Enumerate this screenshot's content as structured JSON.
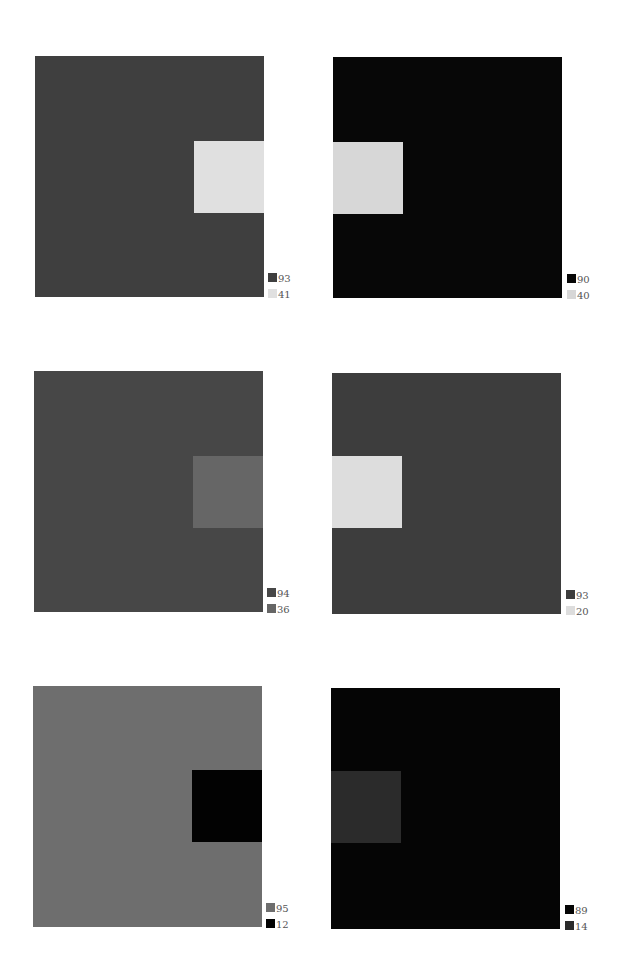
{
  "figures": [
    {
      "id": "panel-1",
      "background": {
        "value": "93",
        "color": "#3f3f3f"
      },
      "inner": {
        "value": "41",
        "color": "#e0e0e0",
        "side": "right"
      },
      "box": {
        "left": 35,
        "top": 56
      },
      "inner_offset": {
        "left": 159,
        "top": 85
      },
      "legend_pos": {
        "left": 268,
        "top": 272
      }
    },
    {
      "id": "panel-2",
      "background": {
        "value": "90",
        "color": "#070707"
      },
      "inner": {
        "value": "40",
        "color": "#d7d7d7",
        "side": "left"
      },
      "box": {
        "left": 333,
        "top": 57
      },
      "inner_offset": {
        "left": 0,
        "top": 85
      },
      "legend_pos": {
        "left": 567,
        "top": 273
      }
    },
    {
      "id": "panel-3",
      "background": {
        "value": "94",
        "color": "#474747"
      },
      "inner": {
        "value": "36",
        "color": "#666666",
        "side": "right"
      },
      "box": {
        "left": 34,
        "top": 371
      },
      "inner_offset": {
        "left": 159,
        "top": 85
      },
      "legend_pos": {
        "left": 267,
        "top": 587
      }
    },
    {
      "id": "panel-4",
      "background": {
        "value": "93",
        "color": "#3d3d3d"
      },
      "inner": {
        "value": "20",
        "color": "#dddddd",
        "side": "left"
      },
      "box": {
        "left": 332,
        "top": 373
      },
      "inner_offset": {
        "left": 0,
        "top": 83
      },
      "legend_pos": {
        "left": 566,
        "top": 589
      }
    },
    {
      "id": "panel-5",
      "background": {
        "value": "95",
        "color": "#6e6e6e"
      },
      "inner": {
        "value": "12",
        "color": "#020202",
        "side": "right"
      },
      "box": {
        "left": 33,
        "top": 686
      },
      "inner_offset": {
        "left": 159,
        "top": 84
      },
      "legend_pos": {
        "left": 266,
        "top": 902
      }
    },
    {
      "id": "panel-6",
      "background": {
        "value": "89",
        "color": "#050505"
      },
      "inner": {
        "value": "14",
        "color": "#2b2b2b",
        "side": "left"
      },
      "box": {
        "left": 331,
        "top": 688
      },
      "inner_offset": {
        "left": 0,
        "top": 83
      },
      "legend_pos": {
        "left": 565,
        "top": 904
      }
    }
  ]
}
